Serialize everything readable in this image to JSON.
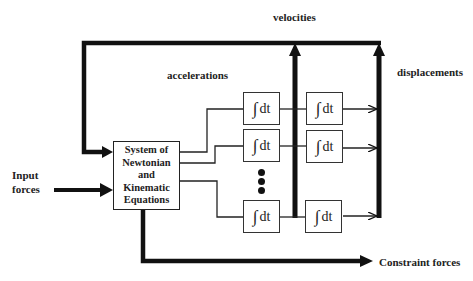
{
  "labels": {
    "velocities": "velocities",
    "accelerations": "accelerations",
    "displacements": "displacements",
    "input_forces_line1": "Input",
    "input_forces_line2": "forces",
    "constraint_forces": "Constraint forces"
  },
  "system_box": {
    "lines": [
      "System of",
      "Newtonian",
      "and",
      "Kinematic",
      "Equations"
    ]
  },
  "integrators": {
    "symbol": "∫",
    "text": "dt",
    "columns": [
      {
        "name": "velocity-integrators",
        "count_visible": 3
      },
      {
        "name": "displacement-integrators",
        "count_visible": 3
      }
    ]
  },
  "colors": {
    "line": "#111111",
    "background": "#ffffff"
  }
}
